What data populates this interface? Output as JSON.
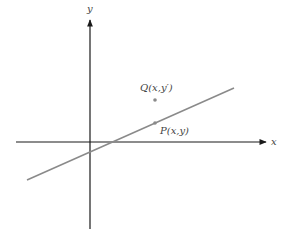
{
  "diagram": {
    "axes": {
      "x_label": "x",
      "y_label": "y",
      "axis_color": "#1a1a1a"
    },
    "line": {
      "color": "#8a8a8a",
      "start": [
        27,
        180
      ],
      "end": [
        234,
        88
      ]
    },
    "points": [
      {
        "id": "Q",
        "label": "Q(x,y′)",
        "pos": [
          155,
          100
        ],
        "color": "#8a8a8a"
      },
      {
        "id": "P",
        "label": "P(x,y)",
        "pos": [
          155,
          123
        ],
        "color": "#8a8a8a"
      }
    ]
  }
}
